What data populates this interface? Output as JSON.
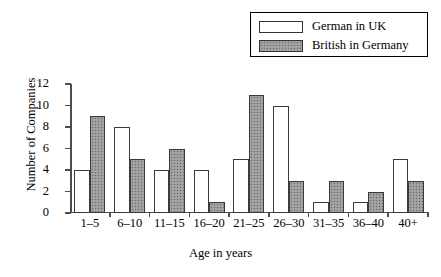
{
  "chart_data": {
    "type": "bar",
    "title": "",
    "xlabel": "Age in years",
    "ylabel": "Number of Companies",
    "categories": [
      "1–5",
      "6–10",
      "11–15",
      "16–20",
      "21–25",
      "26–30",
      "31–35",
      "36–40",
      "40+"
    ],
    "series": [
      {
        "name": "German in UK",
        "values": [
          4,
          8,
          4,
          4,
          5,
          10,
          1,
          1,
          5
        ],
        "style": "open",
        "color": "#ffffff"
      },
      {
        "name": "British in Germany",
        "values": [
          9,
          5,
          6,
          1,
          11,
          3,
          3,
          2,
          3
        ],
        "style": "filled",
        "color": "#9c9c9c"
      }
    ],
    "ylim": [
      0,
      12
    ],
    "yticks": [
      0,
      2,
      4,
      6,
      8,
      10,
      12
    ],
    "ytick_labels": [
      "0",
      "2",
      "4",
      "6",
      "8",
      "10",
      "12"
    ],
    "grid": false,
    "legend_position": "top-right"
  },
  "legend": {
    "items": [
      {
        "label": "German in UK",
        "swatch": "open-square-swatch"
      },
      {
        "label": "British in Germany",
        "swatch": "filled-square-swatch"
      }
    ]
  }
}
